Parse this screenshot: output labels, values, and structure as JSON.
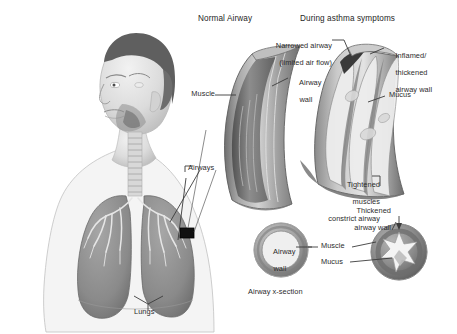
{
  "figure": {
    "domain": "medical-illustration",
    "background": "#ffffff",
    "width": 457,
    "height": 334
  },
  "headings": {
    "normal_airway": "Normal Airway",
    "asthma_symptoms": "During asthma symptoms"
  },
  "body_diagram": {
    "airways_label": "Airways",
    "lungs_label": "Lungs"
  },
  "normal_airway_callouts": {
    "muscle": "Muscle",
    "airway_wall_line1": "Airway",
    "airway_wall_line2": "wall"
  },
  "asthma_callouts": {
    "narrowed_line1": "Narrowed airway",
    "narrowed_line2": "(limited air flow)",
    "inflamed_line1": "Inflamed/",
    "inflamed_line2": "thickened",
    "inflamed_line3": "airway wall",
    "mucus": "Mucus",
    "tightened_line1": "Tightened",
    "tightened_line2": "muscles",
    "tightened_line3": "constrict airway",
    "thickened_line1": "Thickened",
    "thickened_line2": "airway wall"
  },
  "cross_section": {
    "caption": "Airway x-section",
    "normal_inner_line1": "Airway",
    "normal_inner_line2": "wall",
    "muscle": "Muscle",
    "mucus": "Mucus"
  },
  "colors": {
    "text": "#2b2b2b",
    "leader_line": "#3b3b3b",
    "tissue_mid": "#9a9a9a",
    "tissue_dark": "#6e6e6e",
    "tissue_light": "#cfcfcf",
    "lung_fill": "#8e8e8e",
    "skin": "#e2e2e2",
    "hair": "#5a5a5a",
    "callout_box": "#111111"
  }
}
